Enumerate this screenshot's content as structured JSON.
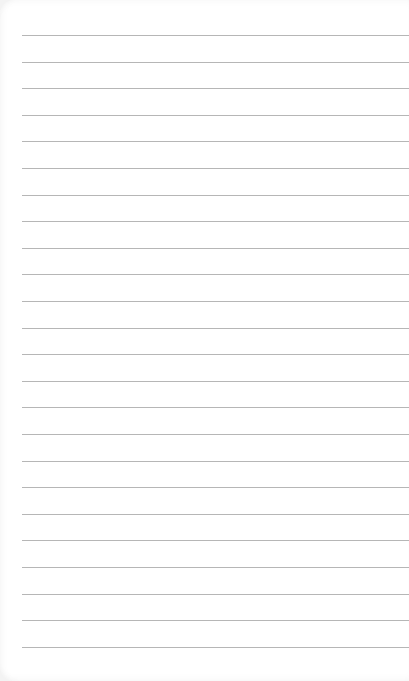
{
  "page": {
    "kind": "blank ruled note paper",
    "line_count": 24,
    "line_color": "#a9a9a9",
    "paper_color": "#ffffff"
  }
}
